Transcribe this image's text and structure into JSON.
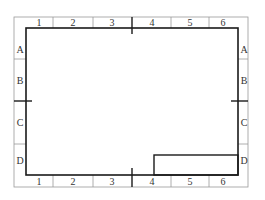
{
  "drawing": {
    "columns_top": [
      "1",
      "2",
      "3",
      "4",
      "5",
      "6"
    ],
    "columns_bottom": [
      "1",
      "2",
      "3",
      "4",
      "5",
      "6"
    ],
    "rows_left": [
      "A",
      "B",
      "C",
      "D"
    ],
    "rows_right": [
      "A",
      "B",
      "C",
      "D"
    ],
    "colors": {
      "border_line": "#1a1a1a",
      "grid_line": "#9a9a9a",
      "label": "#333333",
      "background": "#ffffff"
    },
    "outer_border": {
      "x": 14,
      "y": 17,
      "width": 234,
      "height": 170
    },
    "inner_border": {
      "x": 26,
      "y": 28,
      "width": 212,
      "height": 147
    },
    "title_block": {
      "x": 154,
      "y": 155,
      "width": 84,
      "height": 20
    }
  }
}
